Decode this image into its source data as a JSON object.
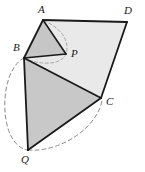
{
  "figure": {
    "kind": "plane-geometry-diagram",
    "background_color": "#ffffff",
    "stroke_color": "#1a1a1a",
    "dashed_color": "#8c8c8c",
    "fill_quadrilateral": "#e9e9e9",
    "fill_triangle_abp": "#c6c6c6",
    "fill_triangle_bqc": "#c8c8c8",
    "labels": {
      "a": "A",
      "b": "B",
      "c": "C",
      "d": "D",
      "p": "P",
      "q": "Q"
    },
    "points": {
      "A": {
        "x": 43,
        "y": 20
      },
      "B": {
        "x": 24,
        "y": 58
      },
      "C": {
        "x": 101,
        "y": 98
      },
      "D": {
        "x": 127,
        "y": 22
      },
      "P": {
        "x": 66,
        "y": 54
      },
      "Q": {
        "x": 28,
        "y": 150
      }
    },
    "label_positions": {
      "A": {
        "x": 38,
        "y": 4
      },
      "B": {
        "x": 13,
        "y": 44
      },
      "C": {
        "x": 106,
        "y": 97
      },
      "D": {
        "x": 124,
        "y": 6
      },
      "P": {
        "x": 71,
        "y": 48
      },
      "Q": {
        "x": 22,
        "y": 155
      }
    },
    "segments": [
      {
        "name": "A-D",
        "from": "A",
        "to": "D"
      },
      {
        "name": "D-C",
        "from": "D",
        "to": "C"
      },
      {
        "name": "C-B",
        "from": "C",
        "to": "B"
      },
      {
        "name": "B-A",
        "from": "B",
        "to": "A"
      },
      {
        "name": "A-P",
        "from": "A",
        "to": "P"
      },
      {
        "name": "B-P",
        "from": "B",
        "to": "P"
      },
      {
        "name": "B-Q",
        "from": "B",
        "to": "Q"
      },
      {
        "name": "Q-C",
        "from": "Q",
        "to": "C"
      }
    ],
    "arcs": [
      {
        "name": "arc-b-to-q",
        "description": "dashed arc from B around the left to Q"
      },
      {
        "name": "arc-q-to-c",
        "description": "dashed arc from Q along the bottom right to C"
      },
      {
        "name": "arc-a-to-b",
        "description": "faint dashed arc from A past P down to B"
      }
    ]
  }
}
